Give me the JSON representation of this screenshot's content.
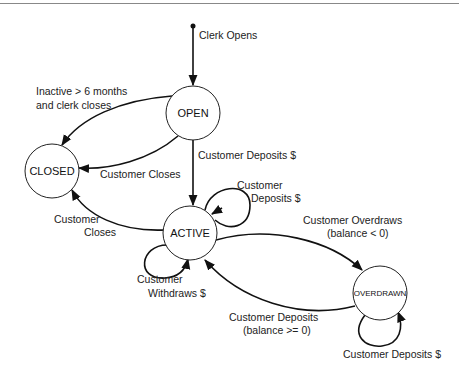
{
  "diagram": {
    "type": "state-machine",
    "colors": {
      "line": "#111111",
      "background": "#ffffff",
      "rule": "#888888"
    },
    "states": [
      {
        "id": "open",
        "label": "OPEN"
      },
      {
        "id": "closed",
        "label": "CLOSED"
      },
      {
        "id": "active",
        "label": "ACTIVE"
      },
      {
        "id": "overdrawn",
        "label": "OVERDRAWN"
      }
    ],
    "transitions": [
      {
        "id": "init",
        "from": "start",
        "to": "open",
        "label_lines": [
          "Clerk Opens"
        ]
      },
      {
        "id": "open-closed-inactive",
        "from": "open",
        "to": "closed",
        "label_lines": [
          "Inactive > 6 months",
          "and clerk closes"
        ]
      },
      {
        "id": "open-closed-customer",
        "from": "open",
        "to": "closed",
        "label_lines": [
          "Customer Closes"
        ]
      },
      {
        "id": "open-active",
        "from": "open",
        "to": "active",
        "label_lines": [
          "Customer Deposits $"
        ]
      },
      {
        "id": "active-active-deposit",
        "from": "active",
        "to": "active",
        "label_lines": [
          "Customer",
          "Deposits $"
        ]
      },
      {
        "id": "active-closed",
        "from": "active",
        "to": "closed",
        "label_lines": [
          "Customer",
          "Closes"
        ]
      },
      {
        "id": "active-active-withdraw",
        "from": "active",
        "to": "active",
        "label_lines": [
          "Customer",
          "Withdraws $"
        ]
      },
      {
        "id": "active-overdrawn",
        "from": "active",
        "to": "overdrawn",
        "label_lines": [
          "Customer Overdraws",
          "(balance < 0)"
        ]
      },
      {
        "id": "overdrawn-active",
        "from": "overdrawn",
        "to": "active",
        "label_lines": [
          "Customer Deposits",
          "(balance >= 0)"
        ]
      },
      {
        "id": "overdrawn-overdrawn",
        "from": "overdrawn",
        "to": "overdrawn",
        "label_lines": [
          "Customer Deposits $"
        ]
      }
    ]
  }
}
